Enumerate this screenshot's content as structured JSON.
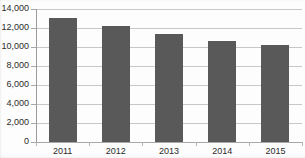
{
  "chart_data": {
    "type": "bar",
    "title": "",
    "subtitle": "",
    "xlabel": "",
    "ylabel": "",
    "categories": [
      "2011",
      "2012",
      "2013",
      "2014",
      "2015"
    ],
    "values": [
      13100,
      12200,
      11400,
      10600,
      10200
    ],
    "series": [
      {
        "name": "",
        "values": [
          13100,
          12200,
          11400,
          10600,
          10200
        ]
      }
    ],
    "ylim": [
      0,
      14000
    ],
    "ytick_values": [
      0,
      2000,
      4000,
      6000,
      8000,
      10000,
      12000,
      14000
    ],
    "ytick_labels": [
      "0",
      "2,000",
      "4,000",
      "6,000",
      "8,000",
      "10,000",
      "12,000",
      "14,000"
    ],
    "xtick_labels": [
      "2011",
      "2012",
      "2013",
      "2014",
      "2015"
    ],
    "grid": "horizontal",
    "legend": "none",
    "legend_entries": [],
    "annotations": [],
    "bar_color": "#595959",
    "gridline_color": "#c8c8c8",
    "axis_color": "#a8a8a8",
    "text_color": "#2b2b2b",
    "background_color": "#fdfdfd"
  }
}
